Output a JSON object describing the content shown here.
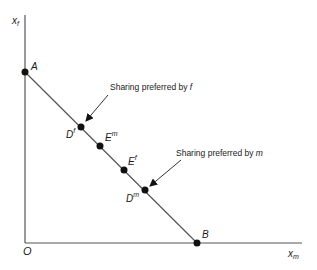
{
  "diagram": {
    "axes": {
      "y_label": "x",
      "y_label_sub": "f",
      "x_label": "x",
      "x_label_sub": "m",
      "origin_label": "O"
    },
    "points": {
      "A": {
        "label": "A"
      },
      "Df": {
        "label": "D",
        "sup": "f"
      },
      "Em": {
        "label": "E",
        "sup": "m"
      },
      "Ef": {
        "label": "E",
        "sup": "f"
      },
      "Dm": {
        "label": "D",
        "sup": "m"
      },
      "B": {
        "label": "B"
      }
    },
    "annotations": {
      "pref_f_text": "Sharing preferred by ",
      "pref_f_var": "f",
      "pref_m_text": "Sharing preferred by ",
      "pref_m_var": "m"
    },
    "colors": {
      "line": "#555555",
      "point": "#111111",
      "text": "#1a1a1a"
    }
  }
}
